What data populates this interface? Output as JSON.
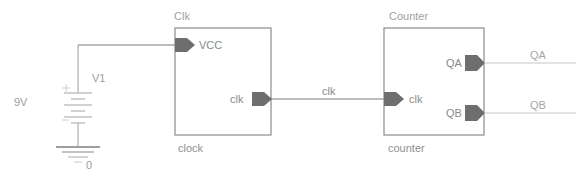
{
  "diagram": {
    "background_color": "#ffffff",
    "wire_color": "#7a7a7a",
    "wire_light_color": "#c8c8c8",
    "block_border_color": "#8c8c8c",
    "pin_fill_color": "#6e6e6e",
    "text_color": "#9a9a9a"
  },
  "source": {
    "voltage_label": "9V",
    "ref_designator": "V1",
    "ground_label": "0"
  },
  "blocks": [
    {
      "title": "Clk",
      "instance_name": "clock",
      "inputs": [
        {
          "label": "VCC"
        }
      ],
      "outputs": [
        {
          "label": "clk"
        }
      ]
    },
    {
      "title": "Counter",
      "instance_name": "counter",
      "inputs": [
        {
          "label": "clk"
        }
      ],
      "outputs": [
        {
          "label": "QA"
        },
        {
          "label": "QB"
        }
      ]
    }
  ],
  "wires": [
    {
      "name": "clk"
    }
  ],
  "nets": [
    {
      "label": "QA"
    },
    {
      "label": "QB"
    }
  ]
}
